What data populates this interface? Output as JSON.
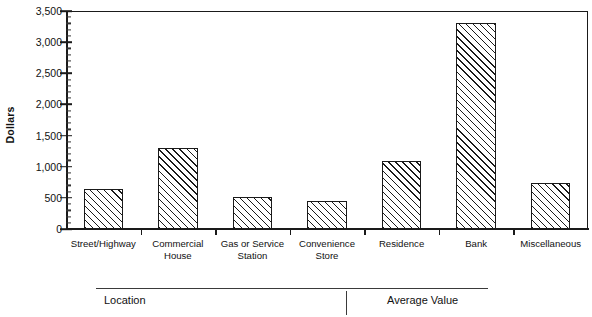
{
  "chart_data": {
    "type": "bar",
    "title": "",
    "subtitle": "",
    "xlabel": "",
    "ylabel": "Dollars",
    "categories": [
      "Street/Highway",
      "Commercial House",
      "Gas or Service Station",
      "Convenience Store",
      "Residence",
      "Bank",
      "Miscellaneous"
    ],
    "values": [
      650,
      1300,
      510,
      450,
      1090,
      3300,
      740
    ],
    "ylim": [
      0,
      3500
    ],
    "ytick_values": [
      0,
      500,
      1000,
      1500,
      2000,
      2500,
      3000,
      3500
    ],
    "ytick_labels": [
      "0",
      "500",
      "1,000",
      "1,500",
      "2,000",
      "2,500",
      "3,000",
      "3,500"
    ],
    "yminor_step": 100,
    "grid": false,
    "legend": "none",
    "bar_fill": "diagonal-hatch",
    "bar_edge_color": "#1a1a1a"
  },
  "axis": {
    "y_title": "Dollars"
  },
  "footer": {
    "location_label": "Location",
    "average_value_label": "Average Value"
  },
  "colors": {
    "ink": "#1a1a1a",
    "background": "#ffffff"
  }
}
